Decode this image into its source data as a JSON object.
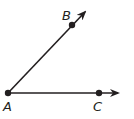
{
  "diagram": {
    "type": "angle",
    "vertex": "A",
    "rays": [
      "AB",
      "AC"
    ],
    "points": [
      {
        "label": "A",
        "x": 8,
        "y": 93
      },
      {
        "label": "B",
        "x": 72,
        "y": 25
      },
      {
        "label": "C",
        "x": 99,
        "y": 93
      }
    ],
    "colors": {
      "stroke": "#231f20",
      "background": "#ffffff"
    }
  }
}
